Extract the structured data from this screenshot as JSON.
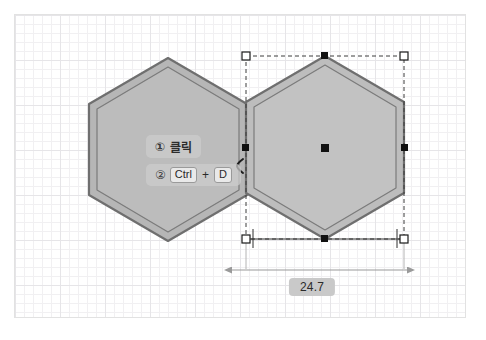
{
  "app": {
    "type": "cad-2d-sketch-canvas",
    "background": "#ffffff",
    "canvas_border": "#e2e2e2"
  },
  "canvas": {
    "grid": {
      "minor_spacing_px": 9,
      "major_spacing_px": 45,
      "minor_color": "#f1f0f2",
      "major_color": "#e6e5e8",
      "visible": true
    }
  },
  "shapes": [
    {
      "name": "hexagon-original",
      "kind": "hexagon",
      "orientation": "pointy-top",
      "fill": "#b6b6b6",
      "stroke": "#6f6f6f",
      "selected": false
    },
    {
      "name": "hexagon-copy",
      "kind": "hexagon",
      "orientation": "pointy-top",
      "fill": "#bdbdbd",
      "stroke": "#6f6f6f",
      "selected": true
    }
  ],
  "selection": {
    "bounding_box_style": "dashed",
    "bounding_box_color": "#3c3c3c",
    "corner_handle_fill": "#ffffff",
    "corner_handle_stroke": "#1a1a1a",
    "edge_handle_fill": "#111111",
    "center_handle_fill": "#111111",
    "handle_count_corner": 4,
    "handle_count_edge": 4,
    "handle_count_center": 1
  },
  "callouts": [
    {
      "name": "callout-step-1",
      "marker": "①",
      "text": "클릭"
    },
    {
      "name": "callout-step-2",
      "marker": "②",
      "keys": [
        "Ctrl",
        "D"
      ],
      "separator": "+"
    }
  ],
  "dimension": {
    "name": "width-dimension",
    "value": "24.7",
    "line_color": "#9a9a9a",
    "arrow_ends": "both",
    "extension_line_color": "#3c3c3c"
  },
  "cursor": {
    "name": "mouse-cursor",
    "glyph": "arrow-move-left"
  }
}
